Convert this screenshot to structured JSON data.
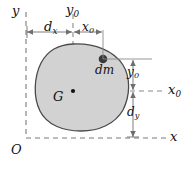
{
  "figure": {
    "background": "#ffffff",
    "body_fill": "#d2d2d2",
    "body_stroke": "#4a4a4a",
    "axis_color": "#7b7b7b",
    "dim_color": "#6f6f6f",
    "text_color": "#111111"
  },
  "labels": {
    "origin": "O",
    "axis_y": "y",
    "axis_x": "x",
    "centroid": "G",
    "mass_element": "dm",
    "y0_top": {
      "base": "y",
      "sub": "0"
    },
    "x0_right": {
      "base": "x",
      "sub": "0"
    },
    "y0_right": {
      "base": "y",
      "sub": "0"
    },
    "dim_dx": {
      "base": "d",
      "sub": "x"
    },
    "dim_x0": {
      "base": "x",
      "sub": "0"
    },
    "dim_dy": {
      "base": "d",
      "sub": "y"
    }
  },
  "geometry": {
    "origin_point": [
      26,
      138
    ],
    "centroid_point": [
      73,
      91
    ],
    "mass_element_point": [
      103,
      59
    ],
    "dx_span": [
      26,
      73
    ],
    "x0_span": [
      73,
      103
    ],
    "y0_span": [
      59,
      91
    ],
    "dy_span": [
      91,
      138
    ]
  }
}
